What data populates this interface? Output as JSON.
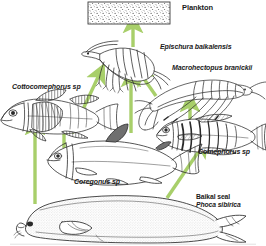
{
  "diagram": {
    "arrow_color": "#a8cf6a",
    "ink_color": "#2b2b2b",
    "background": "#ffffff"
  },
  "labels": {
    "plankton": "Plankton",
    "epischura": "Epischura baikalensis",
    "macrohectopus": "Macrohectopus branickii",
    "cottocomephorus": "Cottocomephorus sp",
    "comephorus": "Comephorus sp",
    "coregonus": "Coregonus sp",
    "seal_common": "Baikal seal",
    "seal_latin": "Phoca sibirica"
  },
  "nodes": [
    {
      "id": "plankton",
      "label": "Plankton",
      "kind": "stippled-box"
    },
    {
      "id": "epischura",
      "label": "Epischura baikalensis",
      "kind": "copepod-drawing"
    },
    {
      "id": "macrohectopus",
      "label": "Macrohectopus branickii",
      "kind": "amphipod-drawing"
    },
    {
      "id": "cottocomephorus",
      "label": "Cottocomephorus sp",
      "kind": "sculpin-drawing"
    },
    {
      "id": "comephorus",
      "label": "Comephorus sp",
      "kind": "golomyanka-drawing"
    },
    {
      "id": "coregonus",
      "label": "Coregonus sp",
      "kind": "whitefish-drawing"
    },
    {
      "id": "seal",
      "label": "Baikal seal Phoca sibirica",
      "kind": "seal-drawing"
    }
  ],
  "arrows": [
    {
      "from": "epischura",
      "to": "plankton"
    },
    {
      "from": "macrohectopus",
      "to": "epischura"
    },
    {
      "from": "cottocomephorus",
      "to": "epischura"
    },
    {
      "from": "coregonus",
      "to": "epischura"
    },
    {
      "from": "comephorus",
      "to": "macrohectopus"
    },
    {
      "from": "coregonus",
      "to": "cottocomephorus"
    },
    {
      "from": "seal",
      "to": "cottocomephorus"
    },
    {
      "from": "seal",
      "to": "comephorus"
    }
  ]
}
